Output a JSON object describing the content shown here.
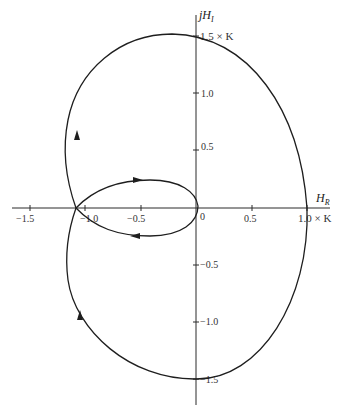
{
  "diagram": {
    "type": "nyquist-plot",
    "axes": {
      "imag_label": "jH",
      "imag_sub": "I",
      "real_label": "H",
      "real_sub": "R"
    },
    "real_ticks": [
      {
        "label": "−1.5",
        "value": -1.5
      },
      {
        "label": "−1.0",
        "value": -1.0
      },
      {
        "label": "−0.5",
        "value": -0.5
      },
      {
        "label": "0",
        "value": 0
      },
      {
        "label": "0.5",
        "value": 0.5
      },
      {
        "label": "1.0 × K",
        "value": 1.0
      }
    ],
    "imag_ticks": [
      {
        "label": "1.5 × K",
        "value": 1.5
      },
      {
        "label": "1.0",
        "value": 1.0
      },
      {
        "label": "0.5",
        "value": 0.5
      },
      {
        "label": "−0.5",
        "value": -0.5
      },
      {
        "label": "−1.0",
        "value": -1.0
      },
      {
        "label": "−1.5",
        "value": -1.5
      }
    ],
    "curve_color": "#1e1e1e",
    "key_points": {
      "real_axis_crossing_outer": 1.0,
      "imag_axis_crossing_top": 1.5,
      "imag_axis_crossing_bottom": -1.5,
      "self_intersection_real": -1.1
    }
  }
}
